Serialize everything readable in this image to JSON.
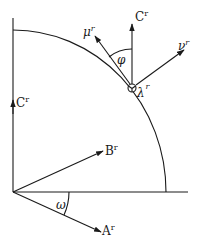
{
  "diagram": {
    "type": "vector-geometry",
    "labels": {
      "mu": {
        "base": "μ",
        "sup": "r"
      },
      "c_top": {
        "base": "C",
        "sup": "r"
      },
      "nu": {
        "base": "ν",
        "sup": "r"
      },
      "phi": {
        "base": "φ"
      },
      "lambda": {
        "base": "λ",
        "sup": "r"
      },
      "c_left": {
        "base": "C",
        "sup": "r"
      },
      "b": {
        "base": "B",
        "sup": "r"
      },
      "omega": {
        "base": "ω"
      },
      "a": {
        "base": "A",
        "sup": "r"
      }
    },
    "colors": {
      "stroke": "#1a1a1a",
      "background": "#ffffff"
    }
  }
}
